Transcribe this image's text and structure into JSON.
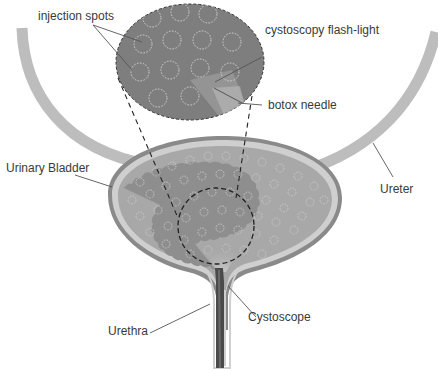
{
  "diagram": {
    "type": "anatomical illustration",
    "colors": {
      "background": "#ffffff",
      "ureter": "#bdbdbd",
      "bladder_wall_outer": "#8a8a8a",
      "bladder_wall_light": "#cfcfcf",
      "bladder_mucosa": "#8e8e8e",
      "bladder_inner_layer": "#a8a8a8",
      "injection_spot_ring": "#c8c8c8",
      "magnified_view": "#7e7e7e",
      "cystoscope": "#4a4a4a",
      "leader_line": "#555555",
      "label_text": "#3a3a3a",
      "dashed_outline": "#222222"
    },
    "labels": {
      "injection_spots": "injection spots",
      "flashlight": "cystoscopy flash-light",
      "needle": "botox needle",
      "bladder": "Urinary Bladder",
      "ureter": "Ureter",
      "cystoscope": "Cystoscope",
      "urethra": "Urethra"
    }
  }
}
